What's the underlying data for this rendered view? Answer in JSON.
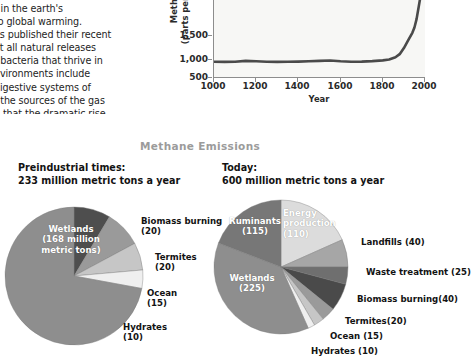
{
  "body_text": {
    "lines": [
      "t in the earth's",
      "to global warming.",
      "es published their recent",
      "at all natural releases",
      "f bacteria that thrive in",
      "nvironments include",
      "digestive systems of",
      "f the sources of the gas",
      "d that the dramatic rise"
    ]
  },
  "chart_data": {
    "type": "line",
    "title": "",
    "xlabel": "Year",
    "ylabel": "Methane\n(parts per billion)",
    "ylabel_line1": "Methane",
    "ylabel_line2": "(parts per billion)",
    "xlim": [
      1000,
      2000
    ],
    "ylim": [
      500,
      1800
    ],
    "xticks": [
      "1000",
      "1200",
      "1400",
      "1600",
      "1800",
      "2000"
    ],
    "xtick_values": [
      1000,
      1200,
      1400,
      1600,
      1800,
      2000
    ],
    "yticks": [
      "500",
      "1,000",
      "1,500"
    ],
    "ytick_values": [
      500,
      1000,
      1500
    ],
    "grid": false,
    "legend": "none",
    "series": [
      {
        "name": "Methane concentration",
        "x": [
          1000,
          1050,
          1100,
          1150,
          1200,
          1250,
          1300,
          1350,
          1400,
          1450,
          1500,
          1550,
          1600,
          1650,
          1700,
          1750,
          1800,
          1830,
          1860,
          1880,
          1900,
          1920,
          1940,
          1950,
          1960,
          1970,
          1980,
          1990,
          2000
        ],
        "values": [
          700,
          698,
          700,
          712,
          706,
          700,
          698,
          700,
          702,
          706,
          712,
          716,
          706,
          700,
          702,
          708,
          718,
          730,
          760,
          800,
          880,
          980,
          1080,
          1150,
          1260,
          1420,
          1580,
          1700,
          1760
        ]
      }
    ]
  },
  "section": {
    "title": "Methane Emissions"
  },
  "pies": {
    "left": {
      "heading_line1": "Preindustrial times:",
      "heading_line2": "233 million metric tons a year",
      "total": 233,
      "slices": [
        {
          "label": "Wetlands",
          "value_text": "(168 million\nmetric tons)",
          "label_line1": "Wetlands",
          "label_line2": "(168 million",
          "label_line3": "metric tons)",
          "value": 168,
          "color": "#8e8e8e"
        },
        {
          "label": "Biomass burning",
          "value_text": "(20)",
          "value": 20,
          "color": "#4e4e4e"
        },
        {
          "label": "Termites",
          "value_text": "(20)",
          "value": 20,
          "color": "#9a9a9a"
        },
        {
          "label": "Ocean",
          "value_text": "(15)",
          "value": 15,
          "color": "#c6c6c6"
        },
        {
          "label": "Hydrates",
          "value_text": "(10)",
          "value": 10,
          "color": "#efefef"
        }
      ]
    },
    "right": {
      "heading_line1": "Today:",
      "heading_line2": "600 million metric tons a year",
      "total": 600,
      "slices": [
        {
          "label": "Energy production",
          "value_text": "(110)",
          "label_line1": "Energy",
          "label_line2": "production",
          "label_line3": "(110)",
          "value": 110,
          "color": "#dcdcdc"
        },
        {
          "label": "Landfills",
          "value_text": "(40)",
          "value": 40,
          "color": "#a6a6a6"
        },
        {
          "label": "Waste treatment",
          "value_text": "(25)",
          "value": 25,
          "color": "#6f6f6f"
        },
        {
          "label": "Biomass burning",
          "value_text": "(40)",
          "value": 40,
          "color": "#4a4a4a"
        },
        {
          "label": "Termites",
          "value_text": "(20)",
          "value": 20,
          "color": "#9a9a9a"
        },
        {
          "label": "Ocean",
          "value_text": "(15)",
          "value": 15,
          "color": "#c6c6c6"
        },
        {
          "label": "Hydrates",
          "value_text": "(10)",
          "value": 10,
          "color": "#efefef"
        },
        {
          "label": "Wetlands",
          "value_text": "(225)",
          "label_line1": "Wetlands",
          "label_line2": "(225)",
          "value": 225,
          "color": "#8e8e8e"
        },
        {
          "label": "Ruminants",
          "value_text": "(115)",
          "label_line1": "Ruminants",
          "label_line2": "(115)",
          "value": 115,
          "color": "#777777"
        }
      ],
      "labels": {
        "landfills": "Landfills (40)",
        "waste": "Waste treatment (25)",
        "biomass": "Biomass burning(40)",
        "termites": "Termites(20)",
        "ocean": "Ocean (15)",
        "hydrates": "Hydrates (10)"
      }
    },
    "left_labels": {
      "biomass_l1": "Biomass burning",
      "biomass_l2": "(20)",
      "termites_l1": "Termites",
      "termites_l2": "(20)",
      "ocean_l1": "Ocean",
      "ocean_l2": "(15)",
      "hydrates_l1": "Hydrates",
      "hydrates_l2": "(10)"
    }
  },
  "colors": {
    "plot_bg": "#f7f7f5",
    "axis": "#8d8d8d",
    "line": "#4a4a4a",
    "title_gray": "#9b9b9b"
  }
}
